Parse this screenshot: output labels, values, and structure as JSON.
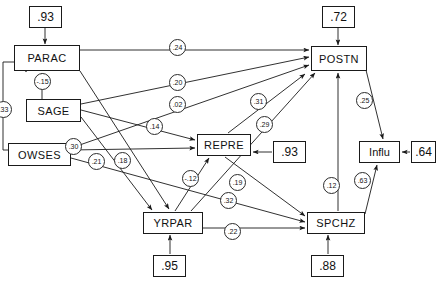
{
  "diagram": {
    "type": "path-diagram",
    "stroke_color": "#1a1a1a",
    "nodes": [
      {
        "id": "PARAC",
        "label": "PARAC",
        "x": 14,
        "y": 45,
        "w": 66,
        "h": 26
      },
      {
        "id": "SAGE",
        "label": "SAGE",
        "x": 26,
        "y": 99,
        "w": 55,
        "h": 23
      },
      {
        "id": "OWSES",
        "label": "OWSES",
        "x": 8,
        "y": 143,
        "w": 63,
        "h": 23
      },
      {
        "id": "YRPAR",
        "label": "YRPAR",
        "x": 143,
        "y": 212,
        "w": 60,
        "h": 22
      },
      {
        "id": "REPRE",
        "label": "REPRE",
        "x": 197,
        "y": 134,
        "w": 54,
        "h": 22
      },
      {
        "id": "POSTN",
        "label": "POSTN",
        "x": 311,
        "y": 46,
        "w": 56,
        "h": 25
      },
      {
        "id": "SPCHZ",
        "label": "SPCHZ",
        "x": 307,
        "y": 212,
        "w": 58,
        "h": 22
      },
      {
        "id": "Influ",
        "label": "Influ",
        "x": 359,
        "y": 141,
        "w": 41,
        "h": 22
      }
    ],
    "residuals": [
      {
        "id": "r_parac",
        "label": ".93",
        "x": 29,
        "y": 6,
        "w": 33,
        "h": 22,
        "target": "PARAC"
      },
      {
        "id": "r_postn",
        "label": ".72",
        "x": 322,
        "y": 6,
        "w": 33,
        "h": 22,
        "target": "POSTN"
      },
      {
        "id": "r_repre",
        "label": ".93",
        "x": 273,
        "y": 141,
        "w": 33,
        "h": 22,
        "target": "REPRE"
      },
      {
        "id": "r_influ",
        "label": ".64",
        "x": 411,
        "y": 141,
        "w": 25,
        "h": 22,
        "target": "Influ"
      },
      {
        "id": "r_yrpar",
        "label": ".95",
        "x": 153,
        "y": 255,
        "w": 33,
        "h": 22,
        "target": "YRPAR"
      },
      {
        "id": "r_spchz",
        "label": ".88",
        "x": 311,
        "y": 255,
        "w": 33,
        "h": 22,
        "target": "SPCHZ"
      }
    ],
    "paths": [
      {
        "id": "p_parac_postn",
        "from": "PARAC",
        "to": "POSTN",
        "coef": ".24",
        "cx": 177,
        "cy": 47
      },
      {
        "id": "p_sage_postn",
        "from": "SAGE",
        "to": "POSTN",
        "coef": ".20",
        "cx": 177,
        "cy": 82
      },
      {
        "id": "p_owses_postn",
        "from": "OWSES",
        "to": "POSTN",
        "coef": ".02",
        "cx": 177,
        "cy": 104
      },
      {
        "id": "p_sage_repre",
        "from": "SAGE",
        "to": "REPRE",
        "coef": ".14",
        "cx": 154,
        "cy": 126
      },
      {
        "id": "p_owses_repre",
        "from": "OWSES",
        "to": "REPRE",
        "coef": ".30",
        "cx": 73,
        "cy": 146
      },
      {
        "id": "p_sage_yrpar",
        "from": "SAGE",
        "to": "YRPAR",
        "coef": ".21",
        "cx": 96,
        "cy": 161
      },
      {
        "id": "p_parac_yrpar",
        "from": "PARAC",
        "to": "YRPAR",
        "coef": ".18",
        "cx": 122,
        "cy": 160
      },
      {
        "id": "p_owses_parac",
        "from": "OWSES",
        "to": "PARAC",
        "coef": ".33",
        "cx": 3,
        "cy": 109
      },
      {
        "id": "p_sage_parac",
        "from": "SAGE",
        "to": "PARAC",
        "coef": "-.15",
        "cx": 42,
        "cy": 81
      },
      {
        "id": "p_repre_postn",
        "from": "REPRE",
        "to": "POSTN",
        "coef": ".31",
        "cx": 258,
        "cy": 101
      },
      {
        "id": "p_yrpar_postn",
        "from": "YRPAR",
        "to": "POSTN",
        "coef": ".29",
        "cx": 264,
        "cy": 124
      },
      {
        "id": "p_yrpar_repre",
        "from": "YRPAR",
        "to": "REPRE",
        "coef": "-.12",
        "cx": 190,
        "cy": 178
      },
      {
        "id": "p_repre_spchz",
        "from": "REPRE",
        "to": "SPCHZ",
        "coef": ".19",
        "cx": 237,
        "cy": 182
      },
      {
        "id": "p_owses_spchz",
        "from": "OWSES",
        "to": "SPCHZ",
        "coef": ".32",
        "cx": 228,
        "cy": 200
      },
      {
        "id": "p_yrpar_spchz",
        "from": "YRPAR",
        "to": "SPCHZ",
        "coef": ".22",
        "cx": 232,
        "cy": 231
      },
      {
        "id": "p_spchz_postn",
        "from": "SPCHZ",
        "to": "POSTN",
        "coef": ".12",
        "cx": 331,
        "cy": 185
      },
      {
        "id": "p_postn_influ",
        "from": "POSTN",
        "to": "Influ",
        "coef": ".25",
        "cx": 364,
        "cy": 100
      },
      {
        "id": "p_spchz_influ",
        "from": "SPCHZ",
        "to": "Influ",
        "coef": ".63",
        "cx": 362,
        "cy": 180
      }
    ]
  }
}
